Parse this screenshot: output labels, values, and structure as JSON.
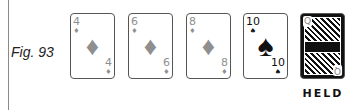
{
  "figure": {
    "label": "Fig. 93"
  },
  "cards": [
    {
      "rank": "4",
      "suit": "♦",
      "suit_name": "diamonds",
      "color": "#8f8f8f",
      "held": false
    },
    {
      "rank": "6",
      "suit": "♦",
      "suit_name": "diamonds",
      "color": "#8f8f8f",
      "held": false
    },
    {
      "rank": "8",
      "suit": "♦",
      "suit_name": "diamonds",
      "color": "#8f8f8f",
      "held": false
    },
    {
      "rank": "10",
      "suit": "♠",
      "suit_name": "spades",
      "color": "#111111",
      "held": false
    },
    {
      "rank": "Q",
      "suit": "♥",
      "suit_name": "hearts",
      "color": "#8f8f8f",
      "held": true,
      "status_label": "HELD"
    }
  ]
}
